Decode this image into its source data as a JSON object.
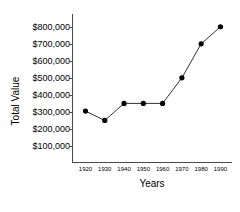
{
  "chart_data": {
    "type": "line",
    "title": "",
    "xlabel": "Years",
    "ylabel": "Total Value",
    "x": [
      1920,
      1930,
      1940,
      1950,
      1960,
      1970,
      1980,
      1990
    ],
    "categories": [
      "1920",
      "1930",
      "1940",
      "1950",
      "1960",
      "1970",
      "1980",
      "1990"
    ],
    "values": [
      305000,
      250000,
      350000,
      350000,
      350000,
      500000,
      700000,
      800000
    ],
    "series": [
      {
        "name": "Total Value",
        "values": [
          305000,
          250000,
          350000,
          350000,
          350000,
          500000,
          700000,
          800000
        ]
      }
    ],
    "y_tick_values": [
      800000,
      700000,
      600000,
      500000,
      400000,
      300000,
      200000,
      100000
    ],
    "y_tick_labels": [
      "$800,000",
      "$700,000",
      "$600,000",
      "$500,000",
      "$400,000",
      "$300,000",
      "$200,000",
      "$100,000"
    ],
    "x_tick_labels": [
      "1920",
      "1930",
      "1940",
      "1950",
      "1960",
      "1970",
      "1980",
      "1990"
    ],
    "ylim": [
      0,
      875000
    ],
    "xlim": [
      1913,
      1996
    ],
    "grid": false,
    "legend": false,
    "marker": "filled-circle",
    "line_color": "#1a1a1a",
    "marker_color": "#000000",
    "axis_color": "#4a4a4a",
    "background_color": "#ffffff"
  }
}
